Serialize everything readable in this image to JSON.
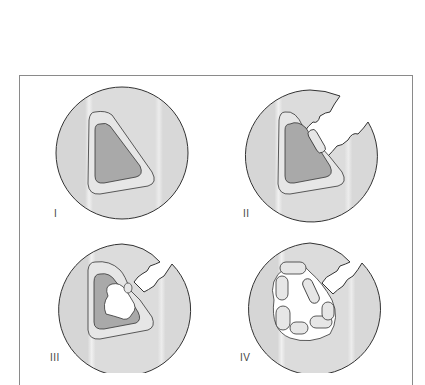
{
  "figure": {
    "panels": [
      {
        "label": "I",
        "stage": "intact cell"
      },
      {
        "label": "II",
        "stage": "wall breached, membrane fragment"
      },
      {
        "label": "III",
        "stage": "cytoplasm disrupted"
      },
      {
        "label": "IV",
        "stage": "membrane fragmented"
      }
    ]
  },
  "colors": {
    "outer": "#d9d9d9",
    "membrane": "#e6e6e6",
    "core": "#a9a9a9",
    "stroke": "#333333",
    "frame": "#8a8a8a"
  }
}
